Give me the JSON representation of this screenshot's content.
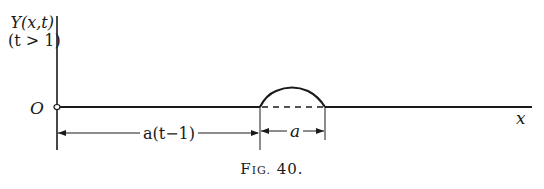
{
  "figure": {
    "y_axis_label_line1": "Y(x,t)",
    "y_axis_label_line2": "(t > 1)",
    "origin_label": "O",
    "x_axis_label": "x",
    "dimension_left_label": "a(t−1)",
    "dimension_right_label": "a",
    "caption_first": "F",
    "caption_smallcaps": "IG.",
    "caption_number": " 40."
  }
}
